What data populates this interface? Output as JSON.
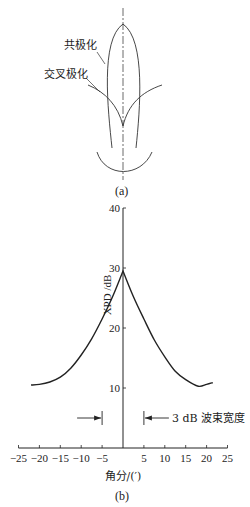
{
  "figure_a": {
    "caption": "(a)",
    "labels": {
      "co_polarization": "共极化",
      "cross_polarization": "交叉极化"
    }
  },
  "figure_b": {
    "caption": "(b)",
    "annotation": "3 dB 波束宽度"
  },
  "chart_data": {
    "type": "line",
    "title": "",
    "xlabel": "角分/(′)",
    "ylabel": "XPD /dB",
    "xlim": [
      -25,
      25
    ],
    "ylim": [
      0,
      40
    ],
    "xticks": [
      -25,
      -20,
      -15,
      -10,
      -5,
      5,
      10,
      15,
      20,
      25
    ],
    "yticks": [
      10,
      20,
      30,
      40
    ],
    "grid": false,
    "series": [
      {
        "name": "XPD",
        "x": [
          -22,
          -20,
          -17.5,
          -15,
          -12.5,
          -10,
          -7.5,
          -5,
          -2.5,
          0,
          2.5,
          5,
          7.5,
          10,
          12.5,
          15,
          18,
          20,
          21.5
        ],
        "values": [
          10.5,
          10.6,
          11.0,
          11.8,
          13.3,
          15.5,
          18.2,
          21.5,
          25.2,
          29.5,
          25.2,
          21.5,
          18.0,
          15.2,
          12.8,
          11.4,
          10.3,
          10.6,
          10.9
        ]
      }
    ],
    "annotations": [
      {
        "text": "3 dB 波束宽度",
        "x_markers": [
          -5,
          5
        ],
        "y": 5
      }
    ]
  }
}
